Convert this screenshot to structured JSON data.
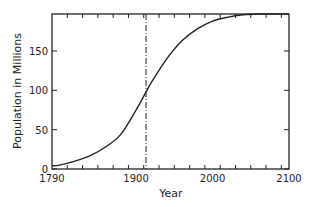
{
  "chart_data": {
    "type": "line",
    "title": "",
    "xlabel": "Year",
    "ylabel": "Population in Millions",
    "xlim": [
      1790,
      2100
    ],
    "ylim": [
      0,
      197
    ],
    "x_ticks": [
      1790,
      1900,
      2000,
      2100
    ],
    "y_ticks": [
      0,
      50,
      100,
      150
    ],
    "grid": false,
    "legend": null,
    "annotations": [
      {
        "type": "vertical-dash-dot-line",
        "x": 1913
      }
    ],
    "series": [
      {
        "name": "Logistic population curve",
        "x": [
          1790,
          1800,
          1820,
          1840,
          1860,
          1880,
          1900,
          1913,
          1920,
          1940,
          1960,
          1980,
          2000,
          2020,
          2040,
          2060,
          2080,
          2100
        ],
        "values": [
          4,
          5,
          10,
          17,
          28,
          44,
          75,
          98,
          110,
          140,
          163,
          178,
          188,
          193,
          196,
          197,
          197,
          197
        ]
      }
    ]
  }
}
